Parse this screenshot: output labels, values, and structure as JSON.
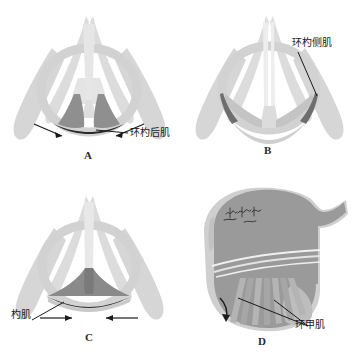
{
  "figure": {
    "width": 359,
    "height": 359,
    "background": "#ffffff"
  },
  "colors": {
    "cartilage_light": "#dcdcdc",
    "cartilage_mid": "#cccccc",
    "cartilage_pale": "#e8e8e8",
    "muscle_dark": "#8c8c8c",
    "muscle_darker": "#6e6e6e",
    "outline_black": "#1a1a1a",
    "vocal_fold": "#bfbfbf",
    "thyroid_body": "#9a9a9a",
    "cricoid_body": "#b5b5b5",
    "fiber_stripe": "#b0b0b0",
    "text": "#1a1a1a"
  },
  "panels": [
    {
      "id": "A",
      "letter": "A",
      "view": "posterior",
      "label": "环杓后肌",
      "label_en": "posterior cricoarytenoid muscle",
      "arrows": 2,
      "arrow_direction": "down-inward"
    },
    {
      "id": "B",
      "letter": "B",
      "view": "superior-adducted",
      "label": "环杓侧肌",
      "label_en": "lateral cricoarytenoid muscle",
      "arrows": 0,
      "arrow_direction": "none"
    },
    {
      "id": "C",
      "letter": "C",
      "view": "posterior-adducted",
      "label": "杓肌",
      "label_en": "arytenoid muscle",
      "arrows": 2,
      "arrow_direction": "horizontal-inward"
    },
    {
      "id": "D",
      "letter": "D",
      "view": "lateral",
      "label": "环甲肌",
      "label_en": "cricothyroid muscle",
      "arrows": 1,
      "arrow_direction": "curved-down",
      "annotation_mark": "handwritten-signature"
    }
  ]
}
